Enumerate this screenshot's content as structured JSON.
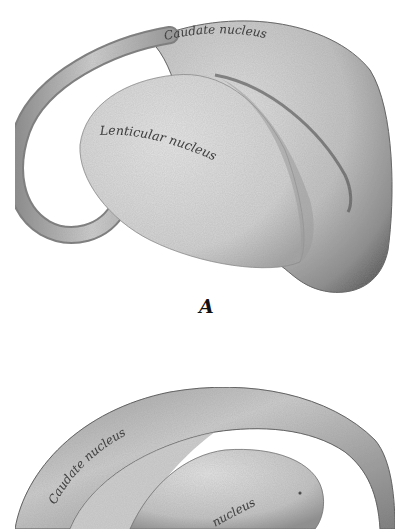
{
  "figure": {
    "panels": [
      {
        "id": "A",
        "caption_letter": "A",
        "labels": {
          "caudate": "Caudate nucleus",
          "lenticular": "Lenticular nucleus"
        }
      },
      {
        "id": "B",
        "labels": {
          "caudate": "Caudate nucleus",
          "lenticular_partial": "nucleus"
        }
      }
    ]
  },
  "colors": {
    "background": "#ffffff",
    "light_gray": "#dcdcdc",
    "mid_gray": "#a8a8a8",
    "dark_gray": "#4a4a4a",
    "ink": "#1a1a1a"
  }
}
